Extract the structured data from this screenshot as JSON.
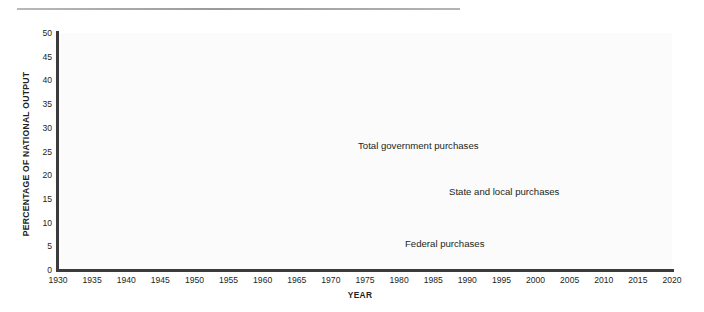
{
  "figure": {
    "y_axis_title": "PERCENTAGE OF NATIONAL OUTPUT",
    "x_axis_title": "YEAR",
    "divider": "horizontal-rule"
  },
  "colors": {
    "total": "#8d8d8f",
    "state_local": "#3b3b3d",
    "federal": "#9a9a9c",
    "axis": "#3b3b3d",
    "plot_background": "#fbfbfb",
    "text": "#231f20"
  },
  "labels": {
    "total": "Total government purchases",
    "state_local": "State and local purchases",
    "federal": "Federal purchases"
  },
  "chart_data": {
    "type": "line",
    "title": "",
    "xlabel": "YEAR",
    "ylabel": "PERCENTAGE OF NATIONAL OUTPUT",
    "xlim": [
      1930,
      2020
    ],
    "ylim": [
      0,
      50
    ],
    "grid": false,
    "legend": "inline-annotations",
    "xticks": [
      1930,
      1935,
      1940,
      1945,
      1950,
      1955,
      1960,
      1965,
      1970,
      1975,
      1980,
      1985,
      1990,
      1995,
      2000,
      2005,
      2010,
      2015,
      2020
    ],
    "yticks": [
      0,
      5,
      10,
      15,
      20,
      25,
      30,
      35,
      40,
      45,
      50
    ],
    "x": [
      1930,
      1931,
      1932,
      1933,
      1934,
      1935,
      1936,
      1937,
      1938,
      1939,
      1940,
      1941,
      1942,
      1943,
      1944,
      1945,
      1946,
      1947,
      1948,
      1949,
      1950,
      1951,
      1952,
      1953,
      1954,
      1955,
      1956,
      1957,
      1958,
      1959,
      1960,
      1961,
      1962,
      1963,
      1964,
      1965,
      1966,
      1967,
      1968,
      1969,
      1970,
      1971,
      1972,
      1973,
      1974,
      1975,
      1976,
      1977,
      1978,
      1979,
      1980,
      1981,
      1982,
      1983,
      1984,
      1985,
      1986,
      1987,
      1988,
      1989,
      1990,
      1991,
      1992,
      1993,
      1994,
      1995,
      1996,
      1997,
      1998,
      1999,
      2000,
      2001,
      2002,
      2003,
      2004,
      2005,
      2006,
      2007,
      2008,
      2009,
      2010,
      2011,
      2012,
      2013,
      2014,
      2015,
      2016,
      2017,
      2018,
      2019
    ],
    "series": [
      {
        "name": "Total government purchases",
        "color": "#8d8d8f",
        "values": [
          10.8,
          12.8,
          15.0,
          14.6,
          15.1,
          14.3,
          15.6,
          14.3,
          15.6,
          15.1,
          14.2,
          20.0,
          38.5,
          46.2,
          45.8,
          37.0,
          15.5,
          12.0,
          12.3,
          14.5,
          13.5,
          19.0,
          22.5,
          23.0,
          21.0,
          19.4,
          19.5,
          20.4,
          21.2,
          20.5,
          20.4,
          21.2,
          21.4,
          21.0,
          20.8,
          20.6,
          21.6,
          22.8,
          22.6,
          22.4,
          22.3,
          22.0,
          21.6,
          20.6,
          21.7,
          21.9,
          21.0,
          20.4,
          20.3,
          20.2,
          21.0,
          20.8,
          21.7,
          21.4,
          21.0,
          21.4,
          21.6,
          21.4,
          21.0,
          20.8,
          21.1,
          21.2,
          20.6,
          20.2,
          19.8,
          19.5,
          19.0,
          18.6,
          18.3,
          18.3,
          18.3,
          18.9,
          19.5,
          19.6,
          19.4,
          19.6,
          19.5,
          19.8,
          21.0,
          22.8,
          23.2,
          22.4,
          21.2,
          20.7,
          20.3,
          20.0,
          19.8,
          19.6,
          19.4,
          19.4
        ]
      },
      {
        "name": "State and local purchases",
        "color": "#3b3b3d",
        "values": [
          8.7,
          10.2,
          11.5,
          10.5,
          10.3,
          10.4,
          9.9,
          9.3,
          10.0,
          9.2,
          8.9,
          7.4,
          5.2,
          3.6,
          3.5,
          3.6,
          4.1,
          4.4,
          4.9,
          5.6,
          6.0,
          6.0,
          6.2,
          6.4,
          6.9,
          7.1,
          7.4,
          7.8,
          8.4,
          8.5,
          8.8,
          9.2,
          9.2,
          9.4,
          9.6,
          9.7,
          10.0,
          10.4,
          10.7,
          11.0,
          11.5,
          11.8,
          11.8,
          11.8,
          12.2,
          12.9,
          12.7,
          12.3,
          12.2,
          12.0,
          12.3,
          11.9,
          12.1,
          11.9,
          11.6,
          11.8,
          12.1,
          12.0,
          11.9,
          12.0,
          12.2,
          12.3,
          12.1,
          11.9,
          11.9,
          11.8,
          11.6,
          11.5,
          11.6,
          11.8,
          11.9,
          12.3,
          12.8,
          12.8,
          12.7,
          12.7,
          12.8,
          13.0,
          13.4,
          13.8,
          13.5,
          12.9,
          12.3,
          12.0,
          11.8,
          11.6,
          11.5,
          11.4,
          11.3,
          11.2
        ]
      },
      {
        "name": "Federal purchases",
        "color": "#9a9a9c",
        "values": [
          1.1,
          1.6,
          2.8,
          4.2,
          4.6,
          3.8,
          5.8,
          4.8,
          5.4,
          5.8,
          5.3,
          12.6,
          33.3,
          42.4,
          41.9,
          33.2,
          11.4,
          7.6,
          7.4,
          8.9,
          7.5,
          13.0,
          16.3,
          16.6,
          14.1,
          12.3,
          12.1,
          12.6,
          12.8,
          12.0,
          11.6,
          12.0,
          12.2,
          11.6,
          11.2,
          10.9,
          11.6,
          12.4,
          11.9,
          11.4,
          10.8,
          10.2,
          9.8,
          8.8,
          9.5,
          9.0,
          8.3,
          8.1,
          8.1,
          8.2,
          8.7,
          8.9,
          9.6,
          9.5,
          9.4,
          9.6,
          9.5,
          9.4,
          9.1,
          8.8,
          8.9,
          8.9,
          8.5,
          8.3,
          7.9,
          7.7,
          7.4,
          7.1,
          6.7,
          6.5,
          6.4,
          6.6,
          6.7,
          6.8,
          6.7,
          6.9,
          6.7,
          6.8,
          7.6,
          9.0,
          9.7,
          9.5,
          8.9,
          8.7,
          8.5,
          8.4,
          8.3,
          8.2,
          8.1,
          8.2
        ]
      }
    ]
  }
}
